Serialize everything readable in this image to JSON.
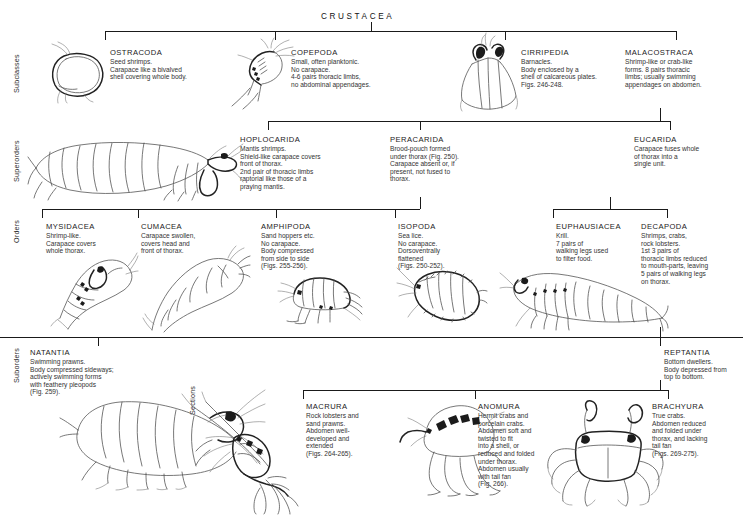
{
  "diagram": {
    "title": "CRUSTACEA",
    "rank_labels": [
      "Subclasses",
      "Superorders",
      "Orders",
      "Suborders",
      "Sections"
    ],
    "line_color": "#1a1a1a",
    "text_color": "#1b1b1b"
  },
  "subclasses": [
    {
      "name": "OSTRACODA",
      "desc": "Seed shrimps.\nCarapace like a bivalved\nshell covering whole body.",
      "figure": "ostracod-illustration"
    },
    {
      "name": "COPEPODA",
      "desc": "Small, often planktonic.\nNo carapace.\n4-6 pairs thoracic limbs,\nno abdominal appendages.",
      "figure": "copepod-illustration"
    },
    {
      "name": "CIRRIPEDIA",
      "desc": "Barnacles.\nBody enclosed by a\nshell of calcareous plates.\nFigs. 246-248.",
      "figure": "barnacle-illustration"
    },
    {
      "name": "MALACOSTRACA",
      "desc": "Shrimp-like or crab-like\nforms. 8 pairs thoracic\nlimbs; usually swimming\nappendages on abdomen.",
      "figure": "none"
    }
  ],
  "superorders": [
    {
      "name": "HOPLOCARIDA",
      "desc": "Mantis shrimps.\nShield-like carapace covers\nfront of thorax.\n2nd pair of thoracic limbs\nraptorial like those of a\npraying mantis.",
      "figure": "mantis-shrimp-illustration"
    },
    {
      "name": "PERACARIDA",
      "desc": "Brood-pouch formed\nunder thorax (Fig. 250).\nCarapace absent or, if\npresent, not fused to\nthorax.",
      "figure": "none"
    },
    {
      "name": "EUCARIDA",
      "desc": "Carapace fuses whole\nof thorax into a\nsingle unit.",
      "figure": "none"
    }
  ],
  "orders": [
    {
      "name": "MYSIDACEA",
      "desc": "Shrimp-like.\nCarapace covers\nwhole thorax.",
      "figure": "mysid-illustration"
    },
    {
      "name": "CUMACEA",
      "desc": "Carapace swollen,\ncovers head and\nfront of thorax.",
      "figure": "cumacean-illustration"
    },
    {
      "name": "AMPHIPODA",
      "desc": "Sand hoppers etc.\nNo carapace.\nBody compressed\nfrom side to side\n(Figs. 255-256).",
      "figure": "amphipod-illustration"
    },
    {
      "name": "ISOPODA",
      "desc": "Sea lice.\nNo carapace.\nDorsoventrally\nflattened\n(Figs. 250-252).",
      "figure": "isopod-illustration"
    },
    {
      "name": "EUPHAUSIACEA",
      "desc": "Krill.\n7 pairs of\nwalking legs used\nto filter food.",
      "figure": "krill-illustration"
    },
    {
      "name": "DECAPODA",
      "desc": "Shrimps, crabs,\nrock lobsters.\n1st 3 pairs of\nthoracic limbs reduced\nto mouth-parts, leaving\n5 pairs of walking legs\non thorax.",
      "figure": "none"
    }
  ],
  "suborders": [
    {
      "name": "NATANTIA",
      "desc": "Swimming prawns.\nBody compressed sideways;\nactively swimming forms\nwith feathery pleopods\n(Fig. 259).",
      "figure": "prawn-illustration"
    },
    {
      "name": "REPTANTIA",
      "desc": "Bottom dwellers.\nBody depressed from\ntop to bottom.",
      "figure": "none"
    }
  ],
  "sections": [
    {
      "name": "MACRURA",
      "desc": "Rock lobsters and\nsand prawns.\nAbdomen well-\ndeveloped and\nextended\n(Figs. 264-265).",
      "figure": "rock-lobster-illustration"
    },
    {
      "name": "ANOMURA",
      "desc": "Hermit crabs and\nporcelain crabs.\nAbdomen soft and\ntwisted to fit\ninto a shell, or\nreduced and folded\nunder thorax.\nAbdomen usually\nwith tail fan\n(Fig. 266).",
      "figure": "hermit-crab-illustration"
    },
    {
      "name": "BRACHYURA",
      "desc": "True crabs.\nAbdomen reduced\nand folded under\nthorax, and lacking\ntail fan\n(Figs. 269-275).",
      "figure": "crab-illustration"
    }
  ]
}
